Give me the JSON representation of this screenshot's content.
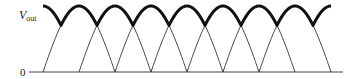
{
  "diagram": {
    "y_label_main": "V",
    "y_label_sub": "out",
    "zero_label": "0",
    "colors": {
      "thin_curve": "#333333",
      "envelope": "#111111",
      "axis": "#444444"
    }
  },
  "chart_data": {
    "type": "line",
    "title": "",
    "ylabel": "Vout",
    "xlabel": "",
    "y_tick_labels": [
      "0"
    ],
    "series": [
      {
        "name": "rectified wave A (thin)",
        "zeros_px": [
          43,
          115,
          187,
          259,
          331
        ]
      },
      {
        "name": "rectified wave B (thin)",
        "zeros_px": [
          79,
          151,
          223,
          295
        ]
      },
      {
        "name": "Vout envelope (thick)",
        "description": "max of A and B; ripple between peak and crossing points"
      }
    ],
    "grid": false
  }
}
